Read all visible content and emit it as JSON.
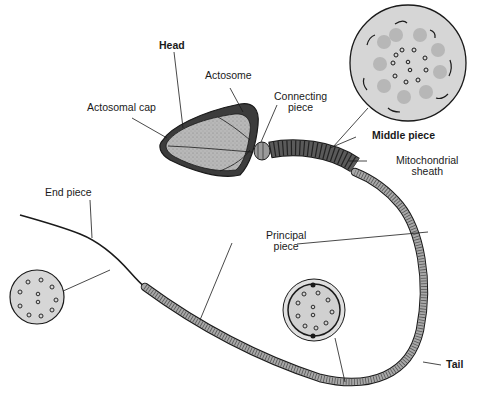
{
  "diagram": {
    "labels": {
      "head": "Head",
      "acrosome": "Actosome",
      "acrosomal_cap": "Actosomal cap",
      "connecting_piece_1": "Connecting",
      "connecting_piece_2": "piece",
      "middle_piece": "Middle piece",
      "mito_sheath_1": "Mitochondrial",
      "mito_sheath_2": "sheath",
      "end_piece": "End piece",
      "principal_piece_1": "Principal",
      "principal_piece_2": "piece",
      "tail": "Tail"
    },
    "cross_sections": [
      {
        "name": "middle-piece-cross-section",
        "shows": "axoneme with outer dense fibers and mitochondria"
      },
      {
        "name": "principal-piece-cross-section",
        "shows": "axoneme 9+2 with fibrous sheath"
      },
      {
        "name": "end-piece-cross-section",
        "shows": "axoneme 9+2 microtubules only"
      }
    ],
    "colors": {
      "outline": "#1a1a1a",
      "head_fill": "#b8b8b8",
      "cap_fill": "#4a4a4a",
      "midpiece_fill": "#555555",
      "tail_fill": "#a8a8a8",
      "section_fill": "#d4d4d4"
    }
  }
}
